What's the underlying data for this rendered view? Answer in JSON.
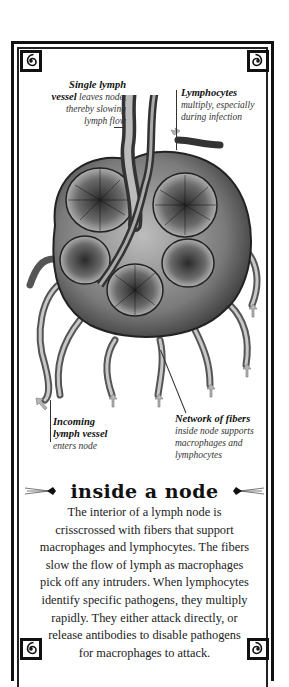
{
  "diagram": {
    "palette": {
      "ink": "#111111",
      "paper": "#ffffff",
      "node_mid": "#7a7a7a",
      "node_light": "#c8c8c8",
      "arrow": "#b5b5b5"
    },
    "callouts": [
      {
        "id": "efferent",
        "title": "Single lymph",
        "title_cont": "vessel",
        "lines": [
          "leaves node,",
          "thereby slowing",
          "lymph flow"
        ]
      },
      {
        "id": "lymphocytes",
        "title": "Lymphocytes",
        "lines": [
          "multiply, especially",
          "during infection"
        ]
      },
      {
        "id": "afferent",
        "title": "Incoming",
        "title2": "lymph vessel",
        "lines": [
          "enters node"
        ]
      },
      {
        "id": "fibers",
        "title": "Network of fibers",
        "lines": [
          "inside node supports",
          "macrophages and",
          "lymphocytes"
        ]
      }
    ],
    "heading": "inside a node",
    "body": [
      "The interior of a lymph node is",
      "crisscrossed with fibers that support",
      "macrophages and lymphocytes. The fibers",
      "slow the flow of lymph as macrophages",
      "pick off any intruders. When lymphocytes",
      "identify specific pathogens, they multiply",
      "rapidly. They either attack directly, or",
      "release antibodies to disable pathogens",
      "for macrophages to attack."
    ]
  }
}
